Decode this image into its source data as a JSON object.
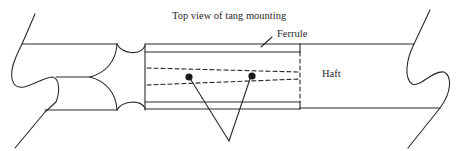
{
  "diagram": {
    "title": "Top view of tang mounting",
    "labels": {
      "ferrule": "Ferrule",
      "haft": "Haft"
    },
    "components": [
      "blade (broken-off left end)",
      "ferrule",
      "tang (dashed, inside ferrule)",
      "rivets/pins (two dots)",
      "haft (broken-off right end)"
    ],
    "colors": {
      "line": "#2a2a2a",
      "background": "#ffffff"
    }
  }
}
